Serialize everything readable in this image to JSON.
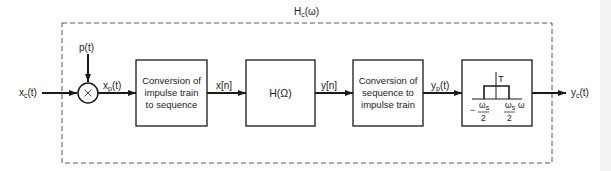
{
  "diagram": {
    "type": "block-diagram",
    "overall_label": {
      "main": "H",
      "sub": "c",
      "arg": "(ω)"
    },
    "input": {
      "main": "x",
      "sub": "c",
      "arg": "(t)"
    },
    "sampling_input": {
      "text": "p(t)"
    },
    "multiplier": {
      "symbol": "×"
    },
    "sampled_signal": {
      "main": "x",
      "sub": "p",
      "arg": "(t)"
    },
    "blocks": [
      {
        "id": "c2d",
        "lines": [
          "Conversion of",
          "impulse train",
          "to sequence"
        ]
      },
      {
        "id": "dt_filter",
        "lines": [
          "H(Ω)"
        ]
      },
      {
        "id": "d2c",
        "lines": [
          "Conversion of",
          "sequence to",
          "impulse train"
        ]
      },
      {
        "id": "reconstruction_filter",
        "gain_label": "T",
        "left_cutoff": {
          "sign": "−",
          "num": "ω",
          "num_sub": "s",
          "den": "2"
        },
        "right_cutoff": {
          "num": "ω",
          "num_sub": "s",
          "den": "2"
        },
        "axis_label": "ω"
      }
    ],
    "signals": {
      "x_n": "x[n]",
      "y_n": "y[n]",
      "y_p": {
        "main": "y",
        "sub": "p",
        "arg": "(t)"
      },
      "output": {
        "main": "y",
        "sub": "c",
        "arg": "(t)"
      }
    },
    "colors": {
      "line": "#1a1a1a",
      "dashed": "#555555",
      "background": "#ffffff"
    }
  }
}
